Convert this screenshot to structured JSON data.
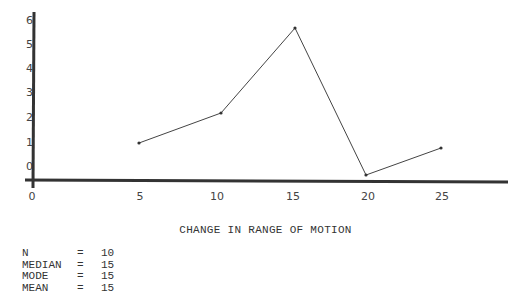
{
  "chart_data": {
    "type": "line",
    "title": "CHANGE IN RANGE OF MOTION",
    "xlabel": "CHANGE IN RANGE OF MOTION",
    "ylabel": "",
    "x": [
      5,
      10,
      15,
      20,
      25
    ],
    "series": [
      {
        "name": "frequency",
        "values": [
          1,
          2.2,
          5.7,
          -0.35,
          0.75
        ]
      }
    ],
    "x_ticks": [
      "0",
      "5",
      "10",
      "15",
      "20",
      "25"
    ],
    "y_ticks": [
      "0",
      "1",
      "2",
      "3",
      "4",
      "5",
      "6"
    ],
    "xlim": [
      0,
      29
    ],
    "ylim": [
      -0.6,
      6.3
    ],
    "grid": false,
    "legend": "none"
  },
  "x_axis": {
    "tick_labels": [
      {
        "label": "0",
        "px": 32
      },
      {
        "label": "5",
        "px": 140
      },
      {
        "label": "10",
        "px": 217
      },
      {
        "label": "15",
        "px": 293
      },
      {
        "label": "20",
        "px": 368
      },
      {
        "label": "25",
        "px": 442
      }
    ]
  },
  "y_axis": {
    "tick_labels": [
      {
        "label": "6",
        "py": 20
      },
      {
        "label": "5",
        "py": 44
      },
      {
        "label": "4",
        "py": 68
      },
      {
        "label": "3",
        "py": 92
      },
      {
        "label": "2",
        "py": 117
      },
      {
        "label": "1",
        "py": 142
      },
      {
        "label": "0",
        "py": 166
      }
    ]
  },
  "points_px": [
    {
      "x": 139,
      "y": 143
    },
    {
      "x": 221,
      "y": 113
    },
    {
      "x": 295,
      "y": 28
    },
    {
      "x": 366,
      "y": 175
    },
    {
      "x": 441,
      "y": 148
    }
  ],
  "stats": [
    {
      "label": "N",
      "eq": "=",
      "value": "10"
    },
    {
      "label": "MEDIAN",
      "eq": "=",
      "value": "15"
    },
    {
      "label": "MODE",
      "eq": "=",
      "value": "15"
    },
    {
      "label": "MEAN",
      "eq": "=",
      "value": "15"
    }
  ],
  "colors": {
    "axis": "#333333",
    "line": "#444444",
    "text": "#444444"
  }
}
